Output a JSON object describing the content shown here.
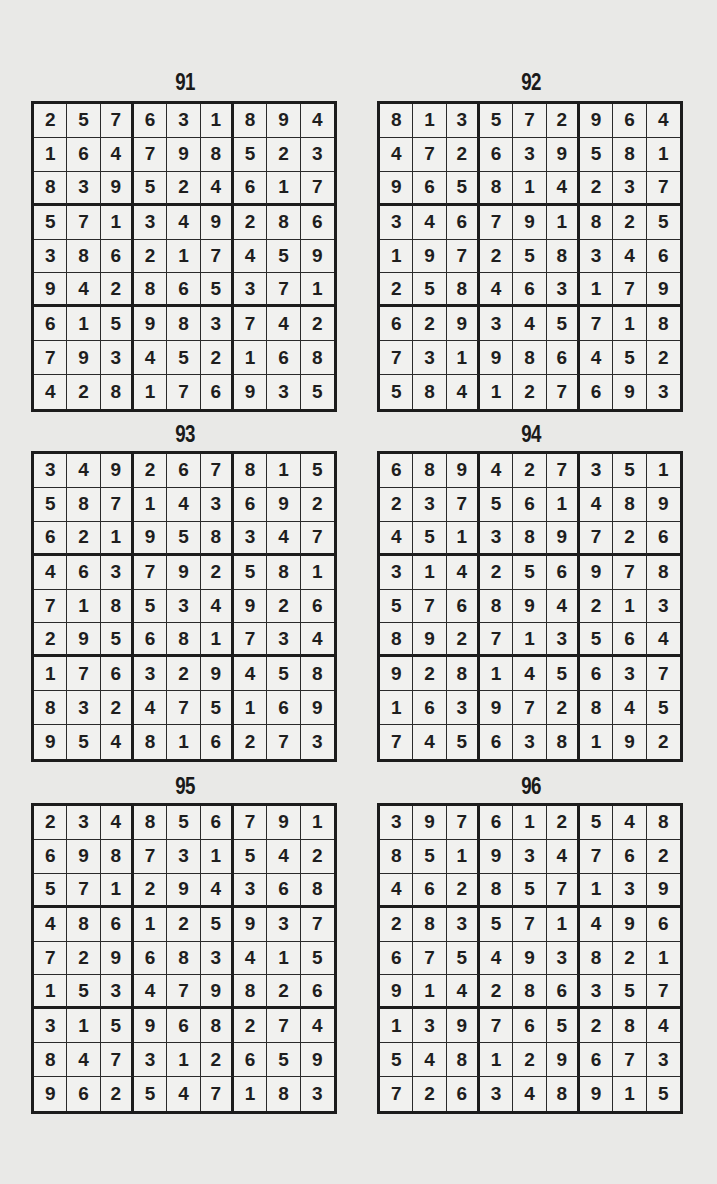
{
  "page": {
    "puzzles": [
      {
        "number": "91",
        "grid": [
          [
            2,
            5,
            7,
            6,
            3,
            1,
            8,
            9,
            4
          ],
          [
            1,
            6,
            4,
            7,
            9,
            8,
            5,
            2,
            3
          ],
          [
            8,
            3,
            9,
            5,
            2,
            4,
            6,
            1,
            7
          ],
          [
            5,
            7,
            1,
            3,
            4,
            9,
            2,
            8,
            6
          ],
          [
            3,
            8,
            6,
            2,
            1,
            7,
            4,
            5,
            9
          ],
          [
            9,
            4,
            2,
            8,
            6,
            5,
            3,
            7,
            1
          ],
          [
            6,
            1,
            5,
            9,
            8,
            3,
            7,
            4,
            2
          ],
          [
            7,
            9,
            3,
            4,
            5,
            2,
            1,
            6,
            8
          ],
          [
            4,
            2,
            8,
            1,
            7,
            6,
            9,
            3,
            5
          ]
        ]
      },
      {
        "number": "92",
        "grid": [
          [
            8,
            1,
            3,
            5,
            7,
            2,
            9,
            6,
            4
          ],
          [
            4,
            7,
            2,
            6,
            3,
            9,
            5,
            8,
            1
          ],
          [
            9,
            6,
            5,
            8,
            1,
            4,
            2,
            3,
            7
          ],
          [
            3,
            4,
            6,
            7,
            9,
            1,
            8,
            2,
            5
          ],
          [
            1,
            9,
            7,
            2,
            5,
            8,
            3,
            4,
            6
          ],
          [
            2,
            5,
            8,
            4,
            6,
            3,
            1,
            7,
            9
          ],
          [
            6,
            2,
            9,
            3,
            4,
            5,
            7,
            1,
            8
          ],
          [
            7,
            3,
            1,
            9,
            8,
            6,
            4,
            5,
            2
          ],
          [
            5,
            8,
            4,
            1,
            2,
            7,
            6,
            9,
            3
          ]
        ]
      },
      {
        "number": "93",
        "grid": [
          [
            3,
            4,
            9,
            2,
            6,
            7,
            8,
            1,
            5
          ],
          [
            5,
            8,
            7,
            1,
            4,
            3,
            6,
            9,
            2
          ],
          [
            6,
            2,
            1,
            9,
            5,
            8,
            3,
            4,
            7
          ],
          [
            4,
            6,
            3,
            7,
            9,
            2,
            5,
            8,
            1
          ],
          [
            7,
            1,
            8,
            5,
            3,
            4,
            9,
            2,
            6
          ],
          [
            2,
            9,
            5,
            6,
            8,
            1,
            7,
            3,
            4
          ],
          [
            1,
            7,
            6,
            3,
            2,
            9,
            4,
            5,
            8
          ],
          [
            8,
            3,
            2,
            4,
            7,
            5,
            1,
            6,
            9
          ],
          [
            9,
            5,
            4,
            8,
            1,
            6,
            2,
            7,
            3
          ]
        ]
      },
      {
        "number": "94",
        "grid": [
          [
            6,
            8,
            9,
            4,
            2,
            7,
            3,
            5,
            1
          ],
          [
            2,
            3,
            7,
            5,
            6,
            1,
            4,
            8,
            9
          ],
          [
            4,
            5,
            1,
            3,
            8,
            9,
            7,
            2,
            6
          ],
          [
            3,
            1,
            4,
            2,
            5,
            6,
            9,
            7,
            8
          ],
          [
            5,
            7,
            6,
            8,
            9,
            4,
            2,
            1,
            3
          ],
          [
            8,
            9,
            2,
            7,
            1,
            3,
            5,
            6,
            4
          ],
          [
            9,
            2,
            8,
            1,
            4,
            5,
            6,
            3,
            7
          ],
          [
            1,
            6,
            3,
            9,
            7,
            2,
            8,
            4,
            5
          ],
          [
            7,
            4,
            5,
            6,
            3,
            8,
            1,
            9,
            2
          ]
        ]
      },
      {
        "number": "95",
        "grid": [
          [
            2,
            3,
            4,
            8,
            5,
            6,
            7,
            9,
            1
          ],
          [
            6,
            9,
            8,
            7,
            3,
            1,
            5,
            4,
            2
          ],
          [
            5,
            7,
            1,
            2,
            9,
            4,
            3,
            6,
            8
          ],
          [
            4,
            8,
            6,
            1,
            2,
            5,
            9,
            3,
            7
          ],
          [
            7,
            2,
            9,
            6,
            8,
            3,
            4,
            1,
            5
          ],
          [
            1,
            5,
            3,
            4,
            7,
            9,
            8,
            2,
            6
          ],
          [
            3,
            1,
            5,
            9,
            6,
            8,
            2,
            7,
            4
          ],
          [
            8,
            4,
            7,
            3,
            1,
            2,
            6,
            5,
            9
          ],
          [
            9,
            6,
            2,
            5,
            4,
            7,
            1,
            8,
            3
          ]
        ]
      },
      {
        "number": "96",
        "grid": [
          [
            3,
            9,
            7,
            6,
            1,
            2,
            5,
            4,
            8
          ],
          [
            8,
            5,
            1,
            9,
            3,
            4,
            7,
            6,
            2
          ],
          [
            4,
            6,
            2,
            8,
            5,
            7,
            1,
            3,
            9
          ],
          [
            2,
            8,
            3,
            5,
            7,
            1,
            4,
            9,
            6
          ],
          [
            6,
            7,
            5,
            4,
            9,
            3,
            8,
            2,
            1
          ],
          [
            9,
            1,
            4,
            2,
            8,
            6,
            3,
            5,
            7
          ],
          [
            1,
            3,
            9,
            7,
            6,
            5,
            2,
            8,
            4
          ],
          [
            5,
            4,
            8,
            1,
            2,
            9,
            6,
            7,
            3
          ],
          [
            7,
            2,
            6,
            3,
            4,
            8,
            9,
            1,
            5
          ]
        ]
      }
    ]
  },
  "colors": {
    "background": "#e9e9e7",
    "grid_fill": "#f1f1ef",
    "ink": "#1c1c1c"
  }
}
